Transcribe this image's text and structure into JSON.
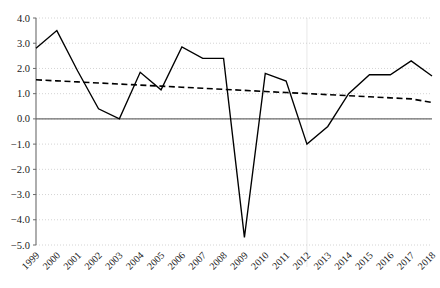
{
  "chart_data": {
    "type": "line",
    "title": "",
    "subtitle": "",
    "xlabel": "",
    "ylabel": "",
    "grid": true,
    "legend": false,
    "legend_position": "none",
    "xlim": [
      1999,
      2018
    ],
    "ylim": [
      -5.0,
      4.0
    ],
    "ytick_labels": [
      "4.0",
      "3.0",
      "2.0",
      "1.0",
      "0.0",
      "−1.0",
      "−2.0",
      "−3.0",
      "−4.0",
      "−5.0"
    ],
    "ytick_values": [
      4.0,
      3.0,
      2.0,
      1.0,
      0.0,
      -1.0,
      -2.0,
      -3.0,
      -4.0,
      -5.0
    ],
    "categories": [
      "1999",
      "2000",
      "2001",
      "2002",
      "2003",
      "2004",
      "2005",
      "2006",
      "2007",
      "2008",
      "2009",
      "2010",
      "2011",
      "2012",
      "2013",
      "2014",
      "2015",
      "2016",
      "2017",
      "2018"
    ],
    "x": [
      1999,
      2000,
      2001,
      2002,
      2003,
      2004,
      2005,
      2006,
      2007,
      2008,
      2009,
      2010,
      2011,
      2012,
      2013,
      2014,
      2015,
      2016,
      2017,
      2018
    ],
    "series": [
      {
        "name": "value",
        "style": "solid",
        "color": "#000000",
        "values": [
          2.8,
          3.5,
          1.9,
          0.4,
          0.0,
          1.85,
          1.15,
          2.85,
          2.4,
          2.4,
          -4.7,
          1.8,
          1.5,
          -1.0,
          -0.3,
          1.0,
          1.75,
          1.75,
          2.3,
          1.7
        ]
      },
      {
        "name": "trend",
        "style": "dashed",
        "color": "#000000",
        "values": [
          1.55,
          1.508,
          1.466,
          1.424,
          1.382,
          1.34,
          1.298,
          1.256,
          1.214,
          1.172,
          1.13,
          1.087,
          1.045,
          1.003,
          0.961,
          0.919,
          0.877,
          0.835,
          0.793,
          0.65
        ]
      }
    ]
  }
}
